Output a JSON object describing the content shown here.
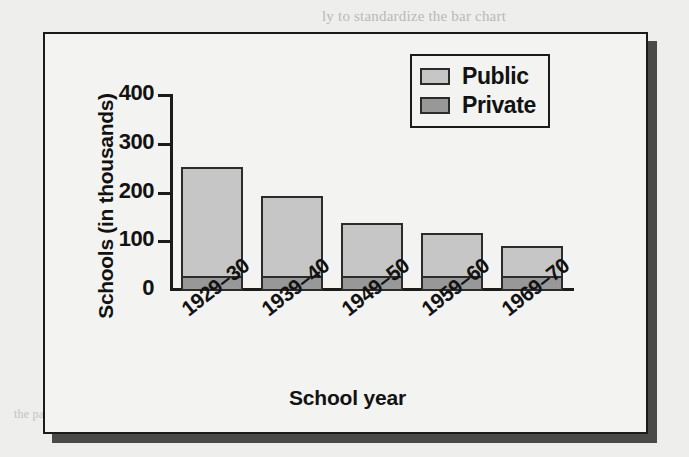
{
  "background_text": {
    "top": "ly to standardize the bar chart",
    "middle": "the summaries in the view",
    "bottom": "the page continues below the figure"
  },
  "colors": {
    "public": "#c6c6c6",
    "private": "#989898",
    "outline": "#2b2b2b",
    "frame": "#1b1b1b",
    "shadow": "#4a4a48",
    "plot_background": "#f3f3f1"
  },
  "legend": {
    "position": "top-right",
    "entries": [
      {
        "label": "Public",
        "color": "#c6c6c6"
      },
      {
        "label": "Private",
        "color": "#989898"
      }
    ]
  },
  "axes": {
    "y_title": "Schools (in thousands)",
    "x_title": "School year",
    "y_ticks": [
      "400",
      "300",
      "200",
      "100",
      "0"
    ]
  },
  "chart_data": {
    "type": "bar",
    "title": "",
    "subtitle": "",
    "stacked": true,
    "xlabel": "School year",
    "ylabel": "Schools (in thousands)",
    "ylim": [
      0,
      400
    ],
    "yticks": [
      0,
      100,
      200,
      300,
      400
    ],
    "grid": false,
    "legend_position": "top-right",
    "categories": [
      "1929–30",
      "1939–40",
      "1949–50",
      "1959–60",
      "1969–70"
    ],
    "series": [
      {
        "name": "Private",
        "values": [
          30,
          30,
          30,
          30,
          30
        ],
        "color": "#989898"
      },
      {
        "name": "Public",
        "values": [
          221,
          162,
          109,
          88,
          62
        ],
        "color": "#c6c6c6"
      }
    ],
    "totals": [
      251,
      192,
      139,
      118,
      92
    ],
    "annotations": []
  }
}
